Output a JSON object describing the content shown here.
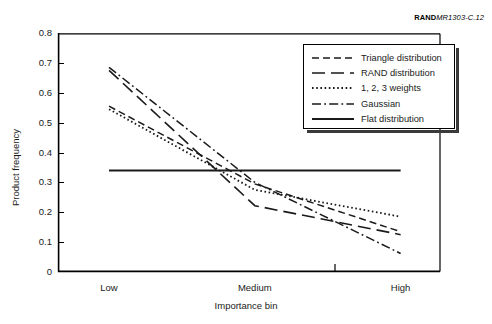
{
  "figure": {
    "clipped_caption": "",
    "source_tag_bold": "RAND",
    "source_tag_rest": "MR1303-C.12"
  },
  "legend": {
    "position": "top-right-inside",
    "items": [
      {
        "label": "Triangle distribution",
        "style": "dashed"
      },
      {
        "label": "RAND distribution",
        "style": "long-dash"
      },
      {
        "label": "1, 2, 3 weights",
        "style": "dotted"
      },
      {
        "label": "Gaussian",
        "style": "dash-dot"
      },
      {
        "label": "Flat distribution",
        "style": "solid"
      }
    ]
  },
  "axes": {
    "ylabel": "Product frequency",
    "xlabel": "Importance bin",
    "yticks": [
      "0.8",
      "0.7",
      "0.6",
      "0.5",
      "0.4",
      "0.3",
      "0.2",
      "0.1",
      "0"
    ],
    "xticklabels": [
      "Low",
      "Medium",
      "High"
    ]
  },
  "chart_data": {
    "type": "line",
    "title": "",
    "xlabel": "Importance bin",
    "ylabel": "Product frequency",
    "categories": [
      "Low",
      "Medium",
      "High"
    ],
    "x": [
      0,
      1,
      2
    ],
    "ylim": [
      0,
      0.8
    ],
    "xlim": [
      -0.35,
      2.27
    ],
    "grid": false,
    "legend": "upper right",
    "series": [
      {
        "name": "Triangle distribution",
        "style": "dashed",
        "values": [
          0.555,
          0.295,
          0.135
        ]
      },
      {
        "name": "RAND distribution",
        "style": "long-dash",
        "values": [
          0.675,
          0.222,
          0.125
        ]
      },
      {
        "name": "1, 2, 3 weights",
        "style": "dotted",
        "values": [
          0.545,
          0.275,
          0.185
        ]
      },
      {
        "name": "Gaussian",
        "style": "dash-dot",
        "values": [
          0.685,
          0.3,
          0.062
        ]
      },
      {
        "name": "Flat distribution",
        "style": "solid",
        "values": [
          0.34,
          0.34,
          0.34
        ]
      }
    ]
  }
}
